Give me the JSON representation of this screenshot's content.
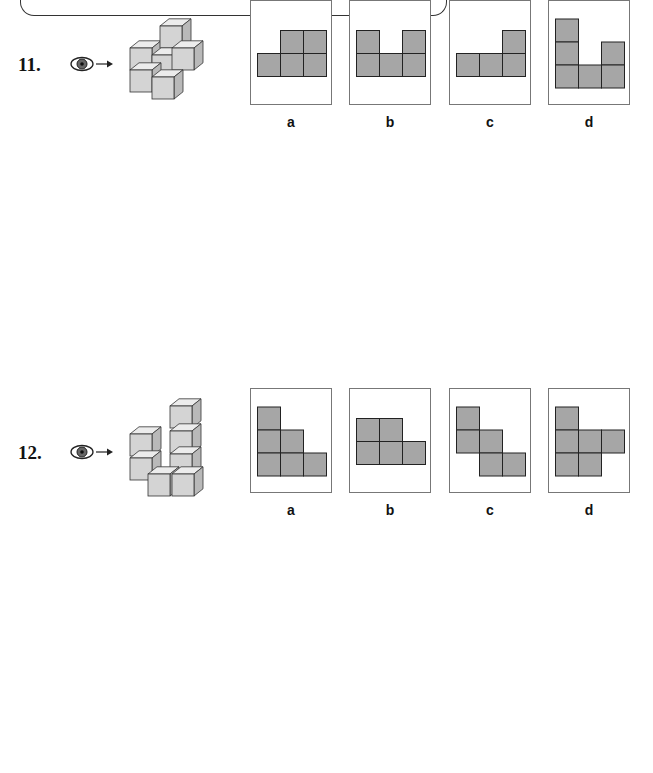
{
  "colors": {
    "cell_fill": "#a6a6a6",
    "cell_stroke": "#222222",
    "panel_border": "#777777",
    "cube_front": "#d4d4d4",
    "cube_top": "#ececec",
    "cube_side": "#b9b9b9"
  },
  "questions": [
    {
      "number": "11.",
      "view_icon": "eye-icon",
      "options": [
        {
          "label": "a",
          "cells": [
            [
              0,
              1
            ],
            [
              0,
              2
            ],
            [
              1,
              0
            ],
            [
              1,
              1
            ],
            [
              1,
              2
            ]
          ]
        },
        {
          "label": "b",
          "cells": [
            [
              0,
              0
            ],
            [
              0,
              2
            ],
            [
              1,
              0
            ],
            [
              1,
              1
            ],
            [
              1,
              2
            ]
          ]
        },
        {
          "label": "c",
          "cells": [
            [
              0,
              2
            ],
            [
              1,
              0
            ],
            [
              1,
              1
            ],
            [
              1,
              2
            ]
          ]
        },
        {
          "label": "d",
          "cells": [
            [
              0,
              0
            ],
            [
              1,
              0
            ],
            [
              1,
              2
            ],
            [
              2,
              0
            ],
            [
              2,
              1
            ],
            [
              2,
              2
            ]
          ]
        }
      ]
    },
    {
      "number": "12.",
      "view_icon": "eye-icon",
      "options": [
        {
          "label": "a",
          "cells": [
            [
              0,
              0
            ],
            [
              1,
              0
            ],
            [
              1,
              1
            ],
            [
              2,
              0
            ],
            [
              2,
              1
            ],
            [
              2,
              2
            ]
          ]
        },
        {
          "label": "b",
          "cells": [
            [
              0,
              0
            ],
            [
              0,
              1
            ],
            [
              1,
              0
            ],
            [
              1,
              1
            ],
            [
              1,
              2
            ]
          ]
        },
        {
          "label": "c",
          "cells": [
            [
              0,
              0
            ],
            [
              1,
              0
            ],
            [
              1,
              1
            ],
            [
              2,
              1
            ],
            [
              2,
              2
            ]
          ]
        },
        {
          "label": "d",
          "cells": [
            [
              0,
              0
            ],
            [
              1,
              0
            ],
            [
              1,
              1
            ],
            [
              1,
              2
            ],
            [
              2,
              0
            ],
            [
              2,
              1
            ]
          ]
        }
      ]
    },
    {
      "number": "13.",
      "view_icon": "eye-icon",
      "options": [
        {
          "label": "a",
          "cells": [
            [
              0,
              0
            ],
            [
              0,
              2
            ],
            [
              1,
              0
            ],
            [
              1,
              1
            ],
            [
              2,
              1
            ],
            [
              2,
              2
            ]
          ]
        },
        {
          "label": "b",
          "cells": [
            [
              0,
              1
            ],
            [
              1,
              0
            ],
            [
              1,
              1
            ],
            [
              1,
              2
            ],
            [
              2,
              0
            ]
          ]
        },
        {
          "label": "c",
          "cells": [
            [
              0,
              0
            ],
            [
              0,
              1
            ],
            [
              1,
              1
            ],
            [
              1,
              2
            ],
            [
              2,
              0
            ]
          ]
        },
        {
          "label": "d",
          "cells": [
            [
              0,
              2
            ],
            [
              1,
              0
            ],
            [
              1,
              1
            ],
            [
              2,
              1
            ],
            [
              2,
              2
            ]
          ]
        }
      ]
    },
    {
      "number": "14.",
      "view_icon": "eye-icon",
      "options": [
        {
          "label": "a",
          "cells": [
            [
              0,
              1
            ],
            [
              1,
              0
            ],
            [
              1,
              2
            ],
            [
              2,
              0
            ],
            [
              2,
              1
            ],
            [
              2,
              2
            ]
          ]
        },
        {
          "label": "b",
          "cells": [
            [
              0,
              1
            ],
            [
              1,
              0
            ],
            [
              1,
              1
            ],
            [
              1,
              2
            ],
            [
              2,
              0
            ],
            [
              2,
              2
            ]
          ]
        },
        {
          "label": "c",
          "cells": [
            [
              0,
              1
            ],
            [
              1,
              0
            ],
            [
              1,
              1
            ],
            [
              1,
              2
            ],
            [
              2,
              0
            ],
            [
              2,
              1
            ],
            [
              2,
              2
            ]
          ]
        },
        {
          "label": "d",
          "cells": [
            [
              0,
              1
            ],
            [
              1,
              1
            ],
            [
              1,
              2
            ],
            [
              2,
              0
            ],
            [
              2,
              1
            ],
            [
              2,
              2
            ]
          ]
        }
      ]
    }
  ]
}
